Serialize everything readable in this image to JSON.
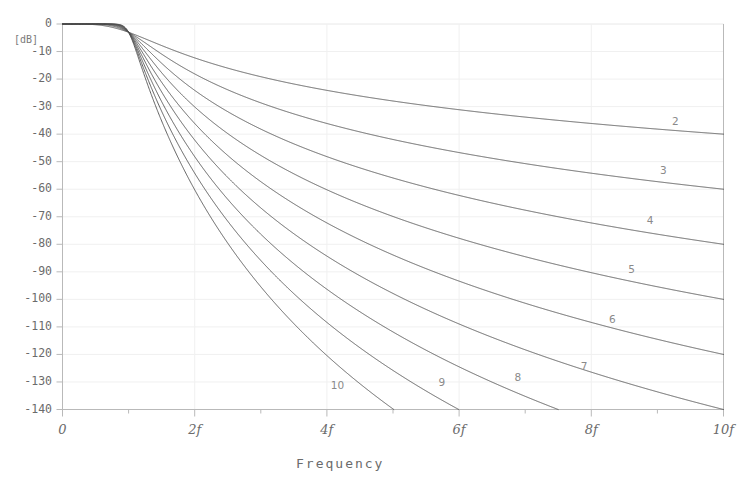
{
  "chart": {
    "title": "",
    "unit_label": "[dB]",
    "xlabel": "Frequency",
    "ylabel": ""
  },
  "chart_data": {
    "type": "line",
    "title": "",
    "xlabel": "Frequency",
    "ylabel": "[dB]",
    "xlim": [
      0,
      10
    ],
    "ylim": [
      -140,
      0
    ],
    "grid": true,
    "legend_position": "inline-right-of-curve",
    "x_tick_labels": [
      "0",
      "2f",
      "4f",
      "6f",
      "8f",
      "10f"
    ],
    "x_tick_values": [
      0,
      2,
      4,
      6,
      8,
      10
    ],
    "x_minor_tick_values": [
      1,
      3,
      5,
      7,
      9
    ],
    "y_tick_labels": [
      "0",
      "-10",
      "-20",
      "-30",
      "-40",
      "-50",
      "-60",
      "-70",
      "-80",
      "-90",
      "-100",
      "-110",
      "-120",
      "-130",
      "-140"
    ],
    "y_tick_values": [
      0,
      -10,
      -20,
      -30,
      -40,
      -50,
      -60,
      -70,
      -80,
      -90,
      -100,
      -110,
      -120,
      -130,
      -140
    ],
    "cutoff_x": 1,
    "cutoff_db": -3,
    "series": [
      {
        "name": "2",
        "order": 2,
        "label": "2",
        "label_x": 9.28,
        "label_db": -35.5,
        "x": [
          0,
          0.2,
          0.4,
          0.6,
          0.8,
          0.9,
          1.0,
          1.2,
          1.5,
          2.0,
          2.5,
          3.0,
          4.0,
          5.0,
          6.0,
          7.0,
          8.0,
          9.0,
          10.0
        ],
        "values": [
          0,
          -0.01,
          -0.11,
          -0.56,
          -1.73,
          -2.51,
          -3.01,
          -4.85,
          -7.65,
          -12.3,
          -16.0,
          -19.1,
          -24.1,
          -28.0,
          -31.1,
          -33.8,
          -36.1,
          -38.2,
          -40.0
        ]
      },
      {
        "name": "3",
        "order": 3,
        "label": "3",
        "label_x": 9.1,
        "label_db": -53.5,
        "x": [
          0,
          0.2,
          0.4,
          0.6,
          0.8,
          0.9,
          1.0,
          1.2,
          1.5,
          2.0,
          2.5,
          3.0,
          4.0,
          5.0,
          6.0,
          7.0,
          8.0,
          9.0,
          10.0
        ],
        "values": [
          0,
          0.0,
          -0.01,
          -0.2,
          -1.13,
          -2.07,
          -3.01,
          -6.22,
          -11.0,
          -18.1,
          -23.9,
          -28.6,
          -36.1,
          -41.9,
          -46.6,
          -50.6,
          -54.1,
          -57.1,
          -60.0
        ]
      },
      {
        "name": "4",
        "order": 4,
        "label": "4",
        "label_x": 8.9,
        "label_db": -71.5,
        "x": [
          0,
          0.2,
          0.4,
          0.6,
          0.8,
          0.9,
          1.0,
          1.2,
          1.5,
          2.0,
          2.5,
          3.0,
          4.0,
          5.0,
          6.0,
          7.0,
          8.0,
          9.0,
          10.0
        ],
        "values": [
          0,
          0.0,
          0.0,
          -0.07,
          -0.74,
          -1.72,
          -3.01,
          -7.71,
          -14.3,
          -24.1,
          -31.8,
          -38.1,
          -48.2,
          -55.9,
          -62.1,
          -67.5,
          -72.2,
          -76.3,
          -80.0
        ]
      },
      {
        "name": "5",
        "order": 5,
        "label": "5",
        "label_x": 8.62,
        "label_db": -89.5,
        "x": [
          0,
          0.2,
          0.4,
          0.6,
          0.8,
          0.9,
          1.0,
          1.2,
          1.5,
          2.0,
          2.5,
          3.0,
          4.0,
          5.0,
          6.0,
          7.0,
          8.0,
          9.0,
          10.0
        ],
        "values": [
          0,
          0.0,
          0.0,
          -0.02,
          -0.48,
          -1.44,
          -3.01,
          -9.23,
          -17.6,
          -30.1,
          -39.8,
          -47.7,
          -60.2,
          -69.9,
          -77.6,
          -84.4,
          -90.2,
          -95.4,
          -100.0
        ]
      },
      {
        "name": "6",
        "order": 6,
        "label": "6",
        "label_x": 8.33,
        "label_db": -107.5,
        "x": [
          0,
          0.2,
          0.4,
          0.6,
          0.8,
          0.9,
          1.0,
          1.2,
          1.5,
          2.0,
          2.5,
          3.0,
          4.0,
          5.0,
          6.0,
          7.0,
          8.0,
          9.0,
          10.0
        ],
        "values": [
          0,
          0.0,
          0.0,
          -0.01,
          -0.31,
          -1.21,
          -3.01,
          -10.8,
          -20.9,
          -36.1,
          -47.7,
          -57.2,
          -72.2,
          -83.9,
          -93.2,
          -101.3,
          -108.2,
          -114.5,
          -120.0
        ]
      },
      {
        "name": "7",
        "order": 7,
        "label": "7",
        "label_x": 7.9,
        "label_db": -124.5,
        "x": [
          0,
          0.2,
          0.4,
          0.6,
          0.8,
          0.9,
          1.0,
          1.2,
          1.5,
          2.0,
          2.5,
          3.0,
          4.0,
          5.0,
          6.0,
          7.0,
          8.0,
          9.0,
          10.0
        ],
        "values": [
          0,
          0.0,
          0.0,
          0.0,
          -0.2,
          -1.02,
          -3.01,
          -12.4,
          -24.2,
          -42.1,
          -55.7,
          -66.8,
          -84.2,
          -97.9,
          -108.7,
          -118.1,
          -126.2,
          -133.5,
          -140.0
        ]
      },
      {
        "name": "8",
        "order": 8,
        "label": "8",
        "label_x": 6.9,
        "label_db": -128.5,
        "x": [
          0,
          0.2,
          0.4,
          0.6,
          0.8,
          0.9,
          1.0,
          1.2,
          1.5,
          2.0,
          2.5,
          3.0,
          4.0,
          5.0,
          6.0,
          7.0,
          7.51
        ],
        "values": [
          0,
          0.0,
          0.0,
          0.0,
          -0.13,
          -0.87,
          -3.01,
          -14.0,
          -27.4,
          -48.2,
          -63.7,
          -76.3,
          -96.3,
          -111.8,
          -124.2,
          -134.9,
          -140.0
        ]
      },
      {
        "name": "9",
        "order": 9,
        "label": "9",
        "label_x": 5.75,
        "label_db": -130.5,
        "x": [
          0,
          0.2,
          0.4,
          0.6,
          0.8,
          0.9,
          1.0,
          1.2,
          1.5,
          2.0,
          2.5,
          3.0,
          4.0,
          5.0,
          5.95
        ],
        "values": [
          0,
          0.0,
          0.0,
          0.0,
          -0.08,
          -0.74,
          -3.01,
          -15.6,
          -30.7,
          -54.2,
          -71.6,
          -85.8,
          -108.3,
          -125.8,
          -140.0
        ]
      },
      {
        "name": "10",
        "order": 10,
        "label": "10",
        "label_x": 4.12,
        "label_db": -131.5,
        "x": [
          0,
          0.2,
          0.4,
          0.6,
          0.8,
          0.9,
          1.0,
          1.2,
          1.5,
          2.0,
          2.5,
          3.0,
          4.0,
          4.18
        ],
        "values": [
          0,
          0.0,
          0.0,
          0.0,
          -0.05,
          -0.63,
          -3.01,
          -17.2,
          -34.0,
          -60.2,
          -79.6,
          -95.4,
          -120.4,
          -140.0
        ]
      }
    ]
  },
  "style": {
    "line_color": "#4f4f4f",
    "axis_color": "#b9b9b9",
    "grid_color": "#f0f0f0",
    "text_color": "#6b6b6b",
    "background": "#ffffff"
  }
}
